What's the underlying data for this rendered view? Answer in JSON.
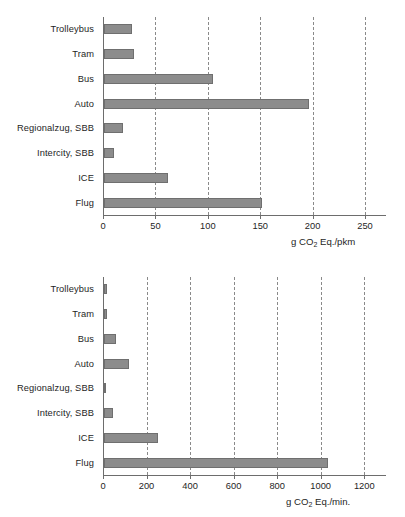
{
  "chart_data": [
    {
      "type": "bar",
      "orientation": "horizontal",
      "title": "",
      "xlabel": "g CO2 Eq./pkm",
      "xlabel_parts": {
        "pre": "g CO",
        "sub": "2",
        "post": " Eq./pkm"
      },
      "ylabel": "",
      "categories": [
        "Trolleybus",
        "Tram",
        "Bus",
        "Auto",
        "Regionalzug, SBB",
        "Intercity, SBB",
        "ICE",
        "Flug"
      ],
      "values": [
        27,
        29,
        104,
        196,
        18,
        10,
        61,
        151
      ],
      "xlim": [
        0,
        270
      ],
      "xticks": [
        0,
        50,
        100,
        150,
        200,
        250
      ],
      "xtick_labels": [
        "0",
        "50",
        "100",
        "150",
        "200",
        "250"
      ],
      "grid": "vertical-dashed",
      "legend": "none",
      "bar_color": "#8c8c8c"
    },
    {
      "type": "bar",
      "orientation": "horizontal",
      "title": "",
      "xlabel": "g CO2 Eq./min.",
      "xlabel_parts": {
        "pre": "g CO",
        "sub": "2",
        "post": " Eq./min."
      },
      "ylabel": "",
      "categories": [
        "Trolleybus",
        "Tram",
        "Bus",
        "Auto",
        "Regionalzug, SBB",
        "Intercity, SBB",
        "ICE",
        "Flug"
      ],
      "values": [
        12,
        12,
        56,
        114,
        11,
        42,
        246,
        1030
      ],
      "xlim": [
        0,
        1300
      ],
      "xticks": [
        0,
        200,
        400,
        600,
        800,
        1000,
        1200
      ],
      "xtick_labels": [
        "0",
        "200",
        "400",
        "600",
        "800",
        "1000",
        "1200"
      ],
      "grid": "vertical-dashed",
      "legend": "none",
      "bar_color": "#8c8c8c"
    }
  ]
}
